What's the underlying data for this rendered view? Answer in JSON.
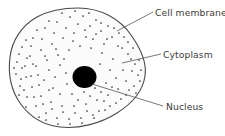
{
  "diagram": {
    "background_color": "#ffffff",
    "labels": {
      "cell_membrane": "Cell membrane",
      "cytoplasm": "Cytoplasm",
      "nucleus": "Nucleus"
    },
    "parts": {
      "cell_membrane": {
        "name": "cell-membrane",
        "stroke_color": "#4a4a4a",
        "fill_color": "#fbfbfb"
      },
      "cytoplasm": {
        "name": "cytoplasm",
        "fill_color": "#fbfbfb",
        "stipple_dot_color": "#2e2e2e"
      },
      "nucleus": {
        "name": "nucleus",
        "fill_color": "#000000",
        "center_x": 84.5,
        "center_y": 77,
        "radius_x": 12,
        "radius_y": 11
      }
    },
    "leader_lines": {
      "cell_membrane": {
        "x1": 117,
        "y1": 31,
        "x2": 153,
        "y2": 12
      },
      "cytoplasm": {
        "x1": 122,
        "y1": 63,
        "x2": 161,
        "y2": 54
      },
      "nucleus": {
        "x1": 92,
        "y1": 84,
        "x2": 163,
        "y2": 106
      }
    },
    "label_positions": {
      "cell_membrane": {
        "x": 155,
        "y": 16
      },
      "cytoplasm": {
        "x": 163,
        "y": 58
      },
      "nucleus": {
        "x": 166,
        "y": 110
      }
    },
    "text_color": "#3b3b3b"
  }
}
